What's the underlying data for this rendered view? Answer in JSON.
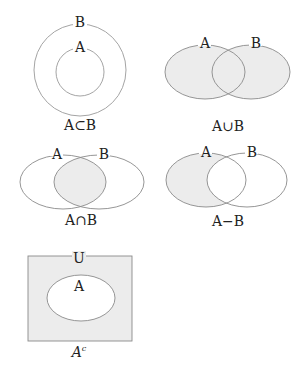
{
  "colors": {
    "stroke": "#8a8a8a",
    "shade": "#ececec",
    "background": "#ffffff",
    "text": "#222222"
  },
  "diagrams": [
    {
      "id": "subset",
      "caption": "A⊂B",
      "labels": {
        "outer": "B",
        "inner": "A"
      }
    },
    {
      "id": "union",
      "caption": "A∪B",
      "labels": {
        "left": "A",
        "right": "B"
      }
    },
    {
      "id": "intersection",
      "caption": "A∩B",
      "labels": {
        "left": "A",
        "right": "B"
      }
    },
    {
      "id": "difference",
      "caption": "A−B",
      "labels": {
        "left": "A",
        "right": "B"
      }
    },
    {
      "id": "complement",
      "caption_base": "A",
      "caption_sup": "c",
      "labels": {
        "universe": "U",
        "set": "A"
      }
    }
  ]
}
